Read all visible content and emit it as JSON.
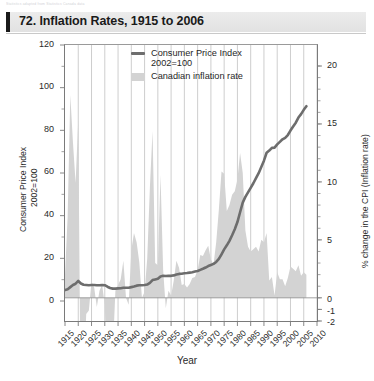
{
  "top_strip_text": "Statistics adapted from Statistics Canada data",
  "title": "72. Inflation Rates, 1915 to 2006",
  "legend": {
    "series_line_label": "Consumer Price Index",
    "series_line_label2": "2002=100",
    "series_area_label": "Canadian inflation rate"
  },
  "axis": {
    "left_title_line1": "Consumer Price Index",
    "left_title_line2": "2002=100",
    "right_title": "% change in the CPI (Inflation rate)",
    "x_title": "Year"
  },
  "colors": {
    "line": "#6d6d6d",
    "area_fill": "#d3d3d3",
    "grid": "#b9b9b9",
    "axis": "#7a7a7a",
    "title_band": "#e7e7e7",
    "title_bar_accent": "#1a1a1a",
    "text": "#231f20"
  },
  "chart_data": {
    "type": "line",
    "title": "72. Inflation Rates, 1915 to 2006",
    "xlabel": "Year",
    "ylabel": "Consumer Price Index 2002=100",
    "y2label": "% change in the CPI (Inflation rate)",
    "xlim": [
      1915,
      2010
    ],
    "ylim": [
      0,
      120
    ],
    "y2lim": [
      -2,
      20
    ],
    "ytick_labels": [
      "0",
      "20",
      "40",
      "60",
      "80",
      "100",
      "120"
    ],
    "ytick_values": [
      0,
      20,
      40,
      60,
      80,
      100,
      120
    ],
    "y2tick_labels": [
      "-2",
      "-1",
      "0",
      "5",
      "10",
      "15",
      "20"
    ],
    "y2tick_values": [
      -2,
      -1,
      0,
      5,
      10,
      15,
      20
    ],
    "xtick_labels": [
      "1915",
      "1920",
      "1925",
      "1930",
      "1935",
      "1940",
      "1945",
      "1950",
      "1955",
      "1960",
      "1965",
      "1970",
      "1975",
      "1980",
      "1985",
      "1990",
      "1995",
      "2000",
      "2005",
      "2010"
    ],
    "xtick_values": [
      1915,
      1920,
      1925,
      1930,
      1935,
      1940,
      1945,
      1950,
      1955,
      1960,
      1965,
      1970,
      1975,
      1980,
      1985,
      1990,
      1995,
      2000,
      2005,
      2010
    ],
    "grid": "vertical gridlines every 5 years",
    "legend_position": "top-center-inside",
    "series": [
      {
        "name": "Consumer Price Index 2002=100",
        "type": "line",
        "axis": "left",
        "x": [
          1915,
          1916,
          1917,
          1918,
          1919,
          1920,
          1921,
          1922,
          1923,
          1924,
          1925,
          1926,
          1927,
          1928,
          1929,
          1930,
          1931,
          1932,
          1933,
          1934,
          1935,
          1936,
          1937,
          1938,
          1939,
          1940,
          1941,
          1942,
          1943,
          1944,
          1945,
          1946,
          1947,
          1948,
          1949,
          1950,
          1951,
          1952,
          1953,
          1954,
          1955,
          1956,
          1957,
          1958,
          1959,
          1960,
          1961,
          1962,
          1963,
          1964,
          1965,
          1966,
          1967,
          1968,
          1969,
          1970,
          1971,
          1972,
          1973,
          1974,
          1975,
          1976,
          1977,
          1978,
          1979,
          1980,
          1981,
          1982,
          1983,
          1984,
          1985,
          1986,
          1987,
          1988,
          1989,
          1990,
          1991,
          1992,
          1993,
          1994,
          1995,
          1996,
          1997,
          1998,
          1999,
          2000,
          2001,
          2002,
          2003,
          2004,
          2005,
          2006
        ],
        "values": [
          5.1,
          5.5,
          6.5,
          7.5,
          8.1,
          9.4,
          8.2,
          7.6,
          7.5,
          7.4,
          7.5,
          7.5,
          7.4,
          7.4,
          7.5,
          7.4,
          6.7,
          6.1,
          5.8,
          5.8,
          5.9,
          6.0,
          6.2,
          6.2,
          6.2,
          6.5,
          6.8,
          7.2,
          7.4,
          7.4,
          7.5,
          7.7,
          8.5,
          9.8,
          10.1,
          10.4,
          11.5,
          11.8,
          11.7,
          11.8,
          11.8,
          12.0,
          12.4,
          12.7,
          12.8,
          13.0,
          13.1,
          13.3,
          13.5,
          13.8,
          14.1,
          14.6,
          15.1,
          15.7,
          16.4,
          16.9,
          17.4,
          18.3,
          19.7,
          21.9,
          24.2,
          26.1,
          28.2,
          30.8,
          33.6,
          37.0,
          41.6,
          46.1,
          48.8,
          50.9,
          53.0,
          55.2,
          57.6,
          59.9,
          62.8,
          65.8,
          69.5,
          70.5,
          71.8,
          71.9,
          73.4,
          74.6,
          75.8,
          76.5,
          77.8,
          79.9,
          81.8,
          83.6,
          86.0,
          87.6,
          89.6,
          91.3
        ]
      },
      {
        "name": "Canadian inflation rate",
        "type": "area",
        "axis": "right",
        "x": [
          1915,
          1916,
          1917,
          1918,
          1919,
          1920,
          1921,
          1922,
          1923,
          1924,
          1925,
          1926,
          1927,
          1928,
          1929,
          1930,
          1931,
          1932,
          1933,
          1934,
          1935,
          1936,
          1937,
          1938,
          1939,
          1940,
          1941,
          1942,
          1943,
          1944,
          1945,
          1946,
          1947,
          1948,
          1949,
          1950,
          1951,
          1952,
          1953,
          1954,
          1955,
          1956,
          1957,
          1958,
          1959,
          1960,
          1961,
          1962,
          1963,
          1964,
          1965,
          1966,
          1967,
          1968,
          1969,
          1970,
          1971,
          1972,
          1973,
          1974,
          1975,
          1976,
          1977,
          1978,
          1979,
          1980,
          1981,
          1982,
          1983,
          1984,
          1985,
          1986,
          1987,
          1988,
          1989,
          1990,
          1991,
          1992,
          1993,
          1994,
          1995,
          1996,
          1997,
          1998,
          1999,
          2000,
          2001,
          2002,
          2003,
          2004,
          2005,
          2006
        ],
        "values": [
          2.0,
          7.0,
          17.5,
          13.4,
          9.9,
          15.4,
          -12.0,
          -7.5,
          -1.4,
          -1.1,
          1.4,
          0.9,
          -0.8,
          0.6,
          1.1,
          -0.6,
          -9.0,
          -9.1,
          -4.8,
          0.6,
          1.1,
          1.6,
          3.2,
          0.0,
          -0.6,
          4.1,
          5.6,
          4.8,
          3.1,
          0.0,
          0.5,
          3.4,
          9.5,
          14.4,
          3.0,
          2.8,
          10.6,
          2.4,
          -0.9,
          0.6,
          0.2,
          1.5,
          3.2,
          2.6,
          1.1,
          1.2,
          0.9,
          1.2,
          1.7,
          1.8,
          2.4,
          3.7,
          3.6,
          4.1,
          4.5,
          3.3,
          2.9,
          4.8,
          7.6,
          10.9,
          10.7,
          7.5,
          8.0,
          8.9,
          9.2,
          10.2,
          12.5,
          10.8,
          5.8,
          4.4,
          4.0,
          4.2,
          4.4,
          4.0,
          5.0,
          4.8,
          5.6,
          1.5,
          1.8,
          0.2,
          2.2,
          1.6,
          1.6,
          1.0,
          1.7,
          2.7,
          2.5,
          2.3,
          2.8,
          1.9,
          2.2,
          2.0
        ]
      }
    ]
  }
}
